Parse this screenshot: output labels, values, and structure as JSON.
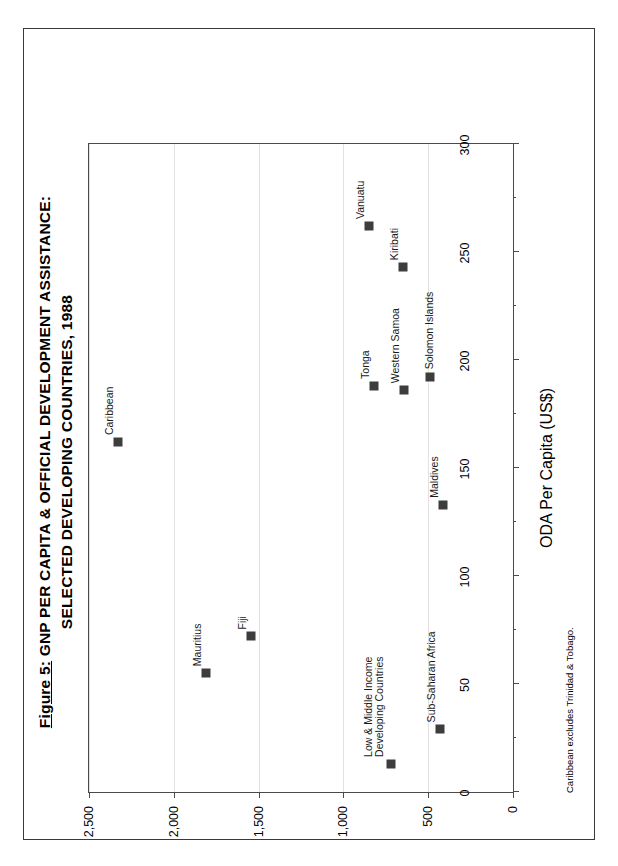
{
  "figure": {
    "number_label": "Figure 5:",
    "title_line1": "GNP PER CAPITA & OFFICIAL DEVELOPMENT ASSISTANCE:",
    "title_line2": "SELECTED DEVELOPING COUNTRIES, 1988",
    "footnote": "Caribbean excludes Trinidad & Tobago."
  },
  "chart_data": {
    "type": "scatter",
    "title": "Figure 5:  GNP PER CAPITA & OFFICIAL DEVELOPMENT ASSISTANCE: SELECTED DEVELOPING COUNTRIES, 1988",
    "xlabel": "ODA Per Capita (US$)",
    "ylabel": "GNP Per Capita (US$)",
    "xlim": [
      0,
      300
    ],
    "ylim": [
      0,
      2500
    ],
    "xticks": [
      0,
      50,
      100,
      150,
      200,
      250,
      300
    ],
    "xticklabels": [
      "0",
      "50",
      "100",
      "150",
      "200",
      "250",
      "300"
    ],
    "yticks": [
      0,
      500,
      1000,
      1500,
      2000,
      2500
    ],
    "yticklabels": [
      "0",
      "500",
      "1,000",
      "1,500",
      "2,000",
      "2,500"
    ],
    "grid": "horizontal",
    "legend": "none",
    "marker_color": "#3d3d3d",
    "points": [
      {
        "label": "Caribbean",
        "x": 162,
        "y": 2330,
        "label_pos": "above"
      },
      {
        "label": "Mauritius",
        "x": 55,
        "y": 1810,
        "label_pos": "above"
      },
      {
        "label": "Fiji",
        "x": 72,
        "y": 1545,
        "label_pos": "above"
      },
      {
        "label": "Tonga",
        "x": 188,
        "y": 820,
        "label_pos": "above"
      },
      {
        "label": "Western Samoa",
        "x": 186,
        "y": 640,
        "label_pos": "above"
      },
      {
        "label": "Solomon Islands",
        "x": 192,
        "y": 490,
        "label_pos": "right"
      },
      {
        "label": "Vanuatu",
        "x": 262,
        "y": 850,
        "label_pos": "above"
      },
      {
        "label": "Kiribati",
        "x": 243,
        "y": 650,
        "label_pos": "above"
      },
      {
        "label": "Maldives",
        "x": 133,
        "y": 410,
        "label_pos": "above"
      },
      {
        "label": "Low & Middle Income Developing Countries",
        "x": 13,
        "y": 720,
        "label_pos": "above-2line"
      },
      {
        "label": "Sub-Saharan Africa",
        "x": 29,
        "y": 430,
        "label_pos": "above"
      }
    ]
  }
}
